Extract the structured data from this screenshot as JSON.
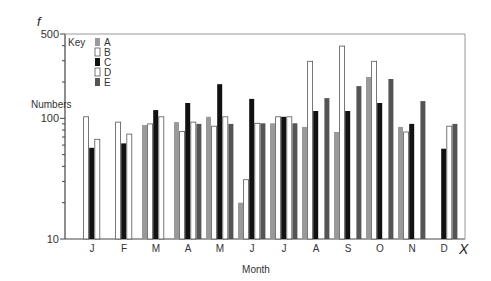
{
  "chart_data": {
    "type": "bar",
    "title": "",
    "y_axis_symbol": "f",
    "x_axis_symbol": "X",
    "xlabel": "Month",
    "ylabel": "Numbers",
    "yscale": "log",
    "ylim": [
      10,
      500
    ],
    "yticks": [
      10,
      100,
      500
    ],
    "grid": false,
    "legend": {
      "title": "Key",
      "position": "top-left-inside"
    },
    "categories": [
      "J",
      "F",
      "M",
      "A",
      "M",
      "J",
      "J",
      "A",
      "S",
      "O",
      "N",
      "D"
    ],
    "series": [
      {
        "name": "A",
        "color": "#9a9a9a",
        "values": [
          null,
          null,
          88,
          93,
          103,
          20,
          91,
          85,
          77,
          220,
          85,
          null
        ]
      },
      {
        "name": "B",
        "color": "#ffffff",
        "values": [
          103,
          93,
          90,
          78,
          86,
          31,
          103,
          297,
          397,
          297,
          77,
          null
        ]
      },
      {
        "name": "C",
        "color": "#111111",
        "values": [
          57,
          62,
          117,
          134,
          192,
          145,
          103,
          115,
          115,
          134,
          90,
          56
        ]
      },
      {
        "name": "D",
        "color": "#ffffff",
        "values": [
          67,
          74,
          103,
          93,
          103,
          91,
          103,
          null,
          null,
          null,
          null,
          86
        ]
      },
      {
        "name": "E",
        "color": "#555555",
        "values": [
          null,
          null,
          null,
          90,
          90,
          91,
          91,
          147,
          185,
          212,
          139,
          90
        ]
      }
    ]
  },
  "labels": {
    "y_symbol": "f",
    "x_symbol": "X",
    "xlabel": "Month",
    "ylabel": "Numbers",
    "legend_title": "Key"
  }
}
